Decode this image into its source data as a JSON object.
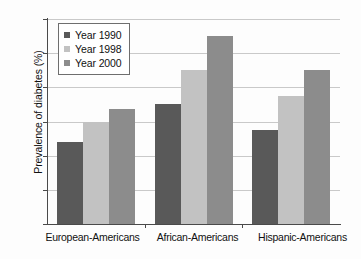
{
  "chart_data": {
    "type": "bar",
    "title": "",
    "subtitle": "",
    "xlabel": "",
    "ylabel": "Prevalence of diabetes (%)",
    "categories": [
      "European-Americans",
      "African-Americans",
      "Hispanic-Americans"
    ],
    "series": [
      {
        "name": "Year 1990",
        "color": "#595959",
        "values": [
          4.8,
          7.0,
          5.5
        ]
      },
      {
        "name": "Year 1998",
        "color": "#c2c2c2",
        "values": [
          6.0,
          9.0,
          7.5
        ]
      },
      {
        "name": "Year 2000",
        "color": "#8c8c8c",
        "values": [
          6.75,
          11.0,
          9.0
        ]
      }
    ],
    "ylim": [
      0,
      12
    ],
    "ytick_values": [
      12,
      10,
      8,
      6,
      4,
      2,
      0
    ],
    "ytick_labels": [
      "12",
      "10",
      "8",
      "6",
      "4",
      "2",
      "0"
    ],
    "grid": true,
    "grid_axis": "y",
    "legend_position": "upper left inside plot",
    "legend_border": true,
    "axis_color": "#4a4a4a",
    "gridline_color": "#c9c9c9",
    "background_color": "#ffffff"
  }
}
